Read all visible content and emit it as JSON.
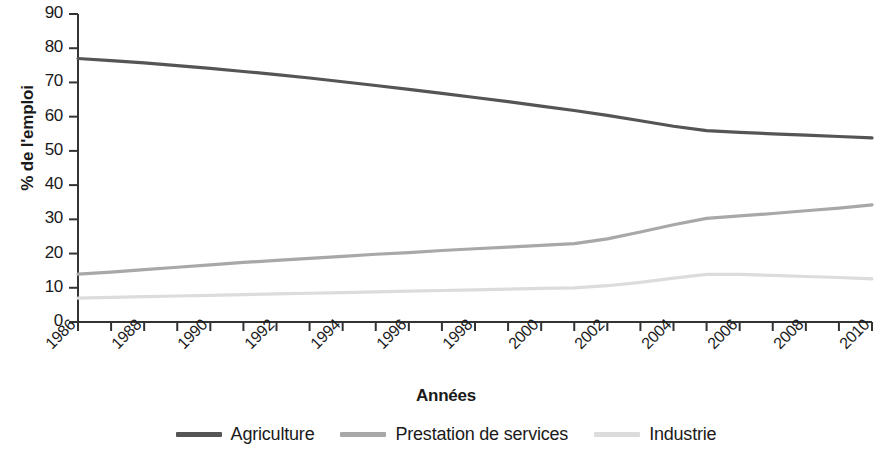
{
  "chart_data": {
    "type": "line",
    "title": "",
    "xlabel": "Années",
    "ylabel": "% de l'emploi",
    "xlim": [
      1986,
      2010
    ],
    "ylim": [
      0,
      90
    ],
    "grid": false,
    "legend_position": "bottom",
    "x": [
      1986,
      1987,
      1988,
      1989,
      1990,
      1991,
      1992,
      1993,
      1994,
      1995,
      1996,
      1997,
      1998,
      1999,
      2000,
      2001,
      2002,
      2003,
      2004,
      2005,
      2006,
      2007,
      2008,
      2009,
      2010
    ],
    "xtick_labels": [
      "1986",
      "1988",
      "1990",
      "1992",
      "1994",
      "1996",
      "1998",
      "2000",
      "2002",
      "2004",
      "2006",
      "2008",
      "2010"
    ],
    "xtick_values": [
      1986,
      1988,
      1990,
      1992,
      1994,
      1996,
      1998,
      2000,
      2002,
      2004,
      2006,
      2008,
      2010
    ],
    "ytick_labels": [
      "0",
      "10",
      "20",
      "30",
      "40",
      "50",
      "60",
      "70",
      "80",
      "90"
    ],
    "ytick_values": [
      0,
      10,
      20,
      30,
      40,
      50,
      60,
      70,
      80,
      90
    ],
    "series": [
      {
        "name": "Agriculture",
        "color": "#555555",
        "values": [
          77.0,
          76.4,
          75.7,
          74.9,
          74.1,
          73.2,
          72.3,
          71.3,
          70.2,
          69.1,
          68.0,
          66.8,
          65.6,
          64.4,
          63.1,
          61.8,
          60.4,
          58.8,
          57.2,
          55.9,
          55.4,
          55.0,
          54.6,
          54.2,
          53.8
        ]
      },
      {
        "name": "Prestation de services",
        "color": "#a8a8a8",
        "values": [
          14.0,
          14.6,
          15.3,
          16.0,
          16.7,
          17.4,
          18.0,
          18.6,
          19.2,
          19.8,
          20.3,
          20.9,
          21.4,
          21.9,
          22.4,
          22.9,
          24.3,
          26.3,
          28.4,
          30.3,
          31.0,
          31.7,
          32.5,
          33.3,
          34.2
        ]
      },
      {
        "name": "Industrie",
        "color": "#dcdcdc",
        "values": [
          7.0,
          7.2,
          7.4,
          7.6,
          7.8,
          8.0,
          8.2,
          8.4,
          8.6,
          8.8,
          9.0,
          9.2,
          9.4,
          9.6,
          9.8,
          10.0,
          10.6,
          11.6,
          12.8,
          13.9,
          13.9,
          13.6,
          13.3,
          13.0,
          12.6
        ]
      }
    ]
  },
  "legend": {
    "items": [
      {
        "label": "Agriculture",
        "color": "#555555"
      },
      {
        "label": "Prestation de services",
        "color": "#a8a8a8"
      },
      {
        "label": "Industrie",
        "color": "#dcdcdc"
      }
    ]
  },
  "axes": {
    "y_title": "% de l'emploi",
    "x_title": "Années",
    "axis_color": "#333333"
  }
}
